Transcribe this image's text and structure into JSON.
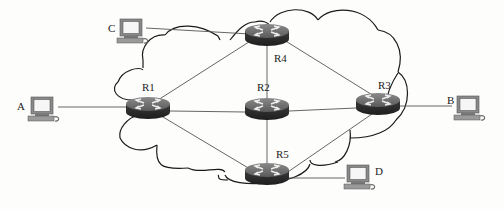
{
  "diagram": {
    "type": "network-topology",
    "cloud_label": "",
    "colors": {
      "background": "#fdfdfb",
      "router_top": "#6e6e6e",
      "router_side": "#2e2e2e",
      "router_arrows": "#e8e8e8",
      "link": "#555555",
      "cloud_outline": "#1a1a1a",
      "pc_body": "#8a8a8a",
      "pc_screen": "#f4f4f4"
    },
    "routers": [
      {
        "id": "R1",
        "label": "R1",
        "x": 148,
        "y": 107
      },
      {
        "id": "R2",
        "label": "R2",
        "x": 267,
        "y": 108
      },
      {
        "id": "R3",
        "label": "R3",
        "x": 378,
        "y": 103
      },
      {
        "id": "R4",
        "label": "R4",
        "x": 267,
        "y": 35
      },
      {
        "id": "R5",
        "label": "R5",
        "x": 267,
        "y": 174
      }
    ],
    "hosts": [
      {
        "id": "A",
        "label": "A",
        "x": 42,
        "y": 107
      },
      {
        "id": "B",
        "label": "B",
        "x": 468,
        "y": 106
      },
      {
        "id": "C",
        "label": "C",
        "x": 131,
        "y": 30
      },
      {
        "id": "D",
        "label": "D",
        "x": 358,
        "y": 175
      }
    ],
    "links": [
      {
        "from": "C",
        "to": "R4"
      },
      {
        "from": "A",
        "to": "R1"
      },
      {
        "from": "R1",
        "to": "R4"
      },
      {
        "from": "R1",
        "to": "R2"
      },
      {
        "from": "R1",
        "to": "R5"
      },
      {
        "from": "R4",
        "to": "R2"
      },
      {
        "from": "R4",
        "to": "R3"
      },
      {
        "from": "R2",
        "to": "R3"
      },
      {
        "from": "R2",
        "to": "R5"
      },
      {
        "from": "R3",
        "to": "R5"
      },
      {
        "from": "R3",
        "to": "B"
      },
      {
        "from": "R5",
        "to": "D"
      }
    ]
  }
}
